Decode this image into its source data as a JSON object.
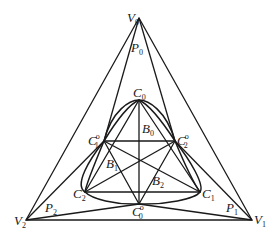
{
  "diagram": {
    "type": "geometric-construction",
    "points": {
      "V0": {
        "label": "V",
        "sub": "0",
        "sup": "",
        "x": 139,
        "y": 18
      },
      "V1": {
        "label": "V",
        "sub": "1",
        "sup": "",
        "x": 252,
        "y": 220
      },
      "V2": {
        "label": "V",
        "sub": "2",
        "sup": "",
        "x": 26,
        "y": 220
      },
      "P0": {
        "label": "P",
        "sub": "0",
        "sup": "",
        "x": 139,
        "y": 50
      },
      "P1": {
        "label": "P",
        "sub": "1",
        "sup": "",
        "x": 228,
        "y": 208
      },
      "P2": {
        "label": "P",
        "sub": "2",
        "sup": "",
        "x": 50,
        "y": 208
      },
      "C0": {
        "label": "C",
        "sub": "0",
        "sup": "",
        "x": 139,
        "y": 100
      },
      "C1": {
        "label": "C",
        "sub": "1",
        "sup": "",
        "x": 200,
        "y": 192
      },
      "C2": {
        "label": "C",
        "sub": "2",
        "sup": "",
        "x": 85,
        "y": 192
      },
      "C0o": {
        "label": "C",
        "sub": "0",
        "sup": "o",
        "x": 139,
        "y": 204
      },
      "C1o": {
        "label": "C",
        "sub": "1",
        "sup": "o",
        "x": 104,
        "y": 141
      },
      "C2o": {
        "label": "C",
        "sub": "2",
        "sup": "o",
        "x": 175,
        "y": 141
      },
      "B0": {
        "label": "B",
        "sub": "0",
        "sup": ""
      },
      "B1": {
        "label": "B",
        "sub": "1",
        "sup": ""
      },
      "B2": {
        "label": "B",
        "sub": "2",
        "sup": ""
      }
    },
    "labels": {
      "V0": {
        "text": "V",
        "sub": "0"
      },
      "V1": {
        "text": "V",
        "sub": "1"
      },
      "V2": {
        "text": "V",
        "sub": "2"
      },
      "P0": {
        "text": "P",
        "sub": "0"
      },
      "P1": {
        "text": "P",
        "sub": "1"
      },
      "P2": {
        "text": "P",
        "sub": "2"
      },
      "C0": {
        "text": "C",
        "sub": "0"
      },
      "C1": {
        "text": "C",
        "sub": "1"
      },
      "C2": {
        "text": "C",
        "sub": "2"
      },
      "C0o": {
        "text": "C",
        "sub": "0",
        "sup": "o"
      },
      "C1o": {
        "text": "C",
        "sub": "1",
        "sup": "o"
      },
      "C2o": {
        "text": "C",
        "sub": "2",
        "sup": "o"
      },
      "B0": {
        "text": "B",
        "sub": "0"
      },
      "B1": {
        "text": "B",
        "sub": "1"
      },
      "B2": {
        "text": "B",
        "sub": "2"
      }
    },
    "sup_o": "o",
    "colors": {
      "stroke": "#1a1a1a",
      "background": "#ffffff"
    }
  }
}
